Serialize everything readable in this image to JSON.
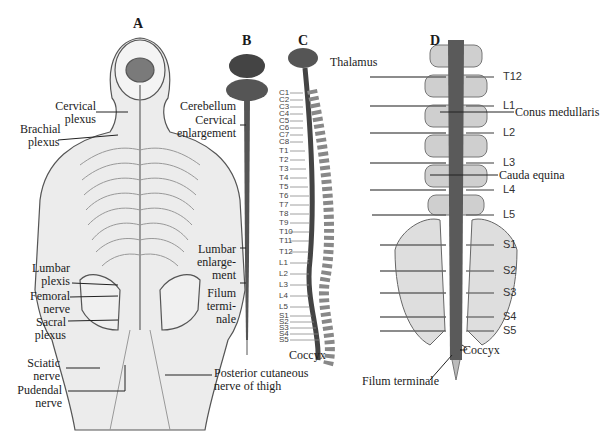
{
  "panels": {
    "a": "A",
    "b": "B",
    "c": "C",
    "d": "D"
  },
  "panel_a": {
    "labels": {
      "cervical_plexus": [
        "Cervical",
        "plexus"
      ],
      "brachial_plexus": [
        "Brachial",
        "plexus"
      ],
      "lumbar_plexus": [
        "Lumbar",
        "plexis"
      ],
      "femoral_nerve": [
        "Femoral",
        "nerve"
      ],
      "sacral_plexus": [
        "Sacral",
        "plexus"
      ],
      "sciatic_nerve": [
        "Sciatic",
        "nerve"
      ],
      "pudendal_nerve": [
        "Pudendal",
        "nerve"
      ],
      "posterior_cutaneous": [
        "Posterior cutaneous",
        "nerve of thigh"
      ]
    }
  },
  "panel_b": {
    "labels": {
      "cerebellum": "Cerebellum",
      "cervical_enlargement": [
        "Cervical",
        "enlargement"
      ],
      "lumbar_enlargement": [
        "Lumbar",
        "enlarge-",
        "ment"
      ],
      "filum_terminale": [
        "Filum",
        "termi-",
        "nale"
      ]
    }
  },
  "panel_c": {
    "thalamus": "Thalamus",
    "coccyx": "Coccyx",
    "segments": [
      "C1",
      "C2",
      "C3",
      "C4",
      "C5",
      "C6",
      "C7",
      "C8",
      "T1",
      "T2",
      "T3",
      "T4",
      "T5",
      "T6",
      "T7",
      "T8",
      "T9",
      "T10",
      "T11",
      "T12",
      "L1",
      "L2",
      "L3",
      "L4",
      "L5",
      "S1",
      "S2",
      "S3",
      "S4",
      "S5"
    ]
  },
  "panel_d": {
    "segments": [
      "T12",
      "L1",
      "L2",
      "L3",
      "L4",
      "L5",
      "S1",
      "S2",
      "S3",
      "S4",
      "S5"
    ],
    "conus_medullaris": "Conus medullaris",
    "cauda_equina": "Cauda equina",
    "coccyx": "Coccyx",
    "filum_terminale": "Filum terminale"
  }
}
